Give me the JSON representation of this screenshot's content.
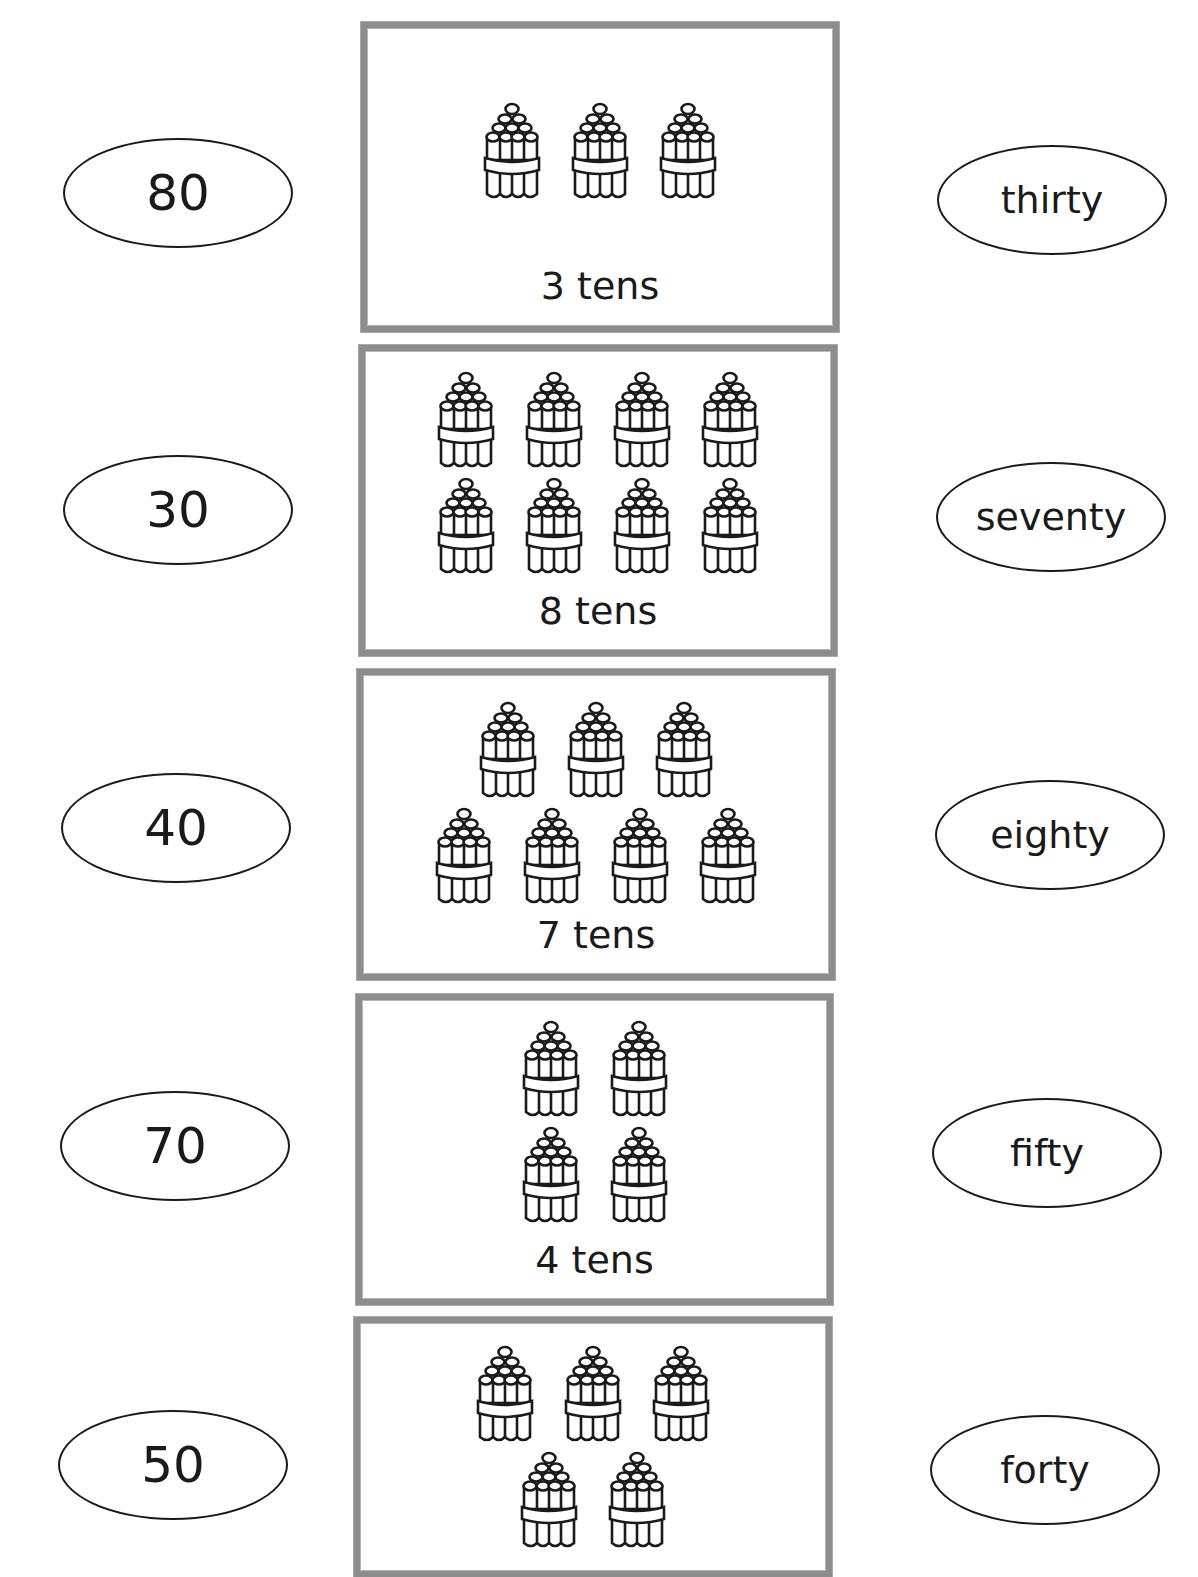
{
  "worksheet": {
    "left_numbers": [
      {
        "label": "80",
        "cx": 178,
        "cy": 193
      },
      {
        "label": "30",
        "cx": 178,
        "cy": 510
      },
      {
        "label": "40",
        "cx": 176,
        "cy": 828
      },
      {
        "label": "70",
        "cx": 175,
        "cy": 1146
      },
      {
        "label": "50",
        "cx": 173,
        "cy": 1465
      }
    ],
    "right_words": [
      {
        "label": "thirty",
        "cx": 1052,
        "cy": 200
      },
      {
        "label": "seventy",
        "cx": 1051,
        "cy": 517
      },
      {
        "label": "eighty",
        "cx": 1050,
        "cy": 835
      },
      {
        "label": "fifty",
        "cx": 1047,
        "cy": 1153
      },
      {
        "label": "forty",
        "cx": 1045,
        "cy": 1470
      }
    ],
    "boxes": [
      {
        "label": "3 tens",
        "tens": 3,
        "rows": [
          3
        ],
        "x": 361,
        "y": 22,
        "w": 478,
        "h": 310,
        "bundles_top": 72,
        "label_top": 236
      },
      {
        "label": "8 tens",
        "tens": 8,
        "rows": [
          4,
          4
        ],
        "x": 359,
        "y": 345,
        "w": 478,
        "h": 311,
        "bundles_top": 18,
        "label_top": 238
      },
      {
        "label": "7 tens",
        "tens": 7,
        "rows": [
          3,
          4
        ],
        "x": 357,
        "y": 669,
        "w": 478,
        "h": 311,
        "bundles_top": 24,
        "label_top": 238
      },
      {
        "label": "4 tens",
        "tens": 4,
        "rows": [
          2,
          2
        ],
        "x": 356,
        "y": 994,
        "w": 477,
        "h": 311,
        "bundles_top": 18,
        "label_top": 238
      },
      {
        "label": "",
        "tens": 5,
        "rows": [
          3,
          2
        ],
        "x": 354,
        "y": 1317,
        "w": 478,
        "h": 260,
        "bundles_top": 20,
        "label_top": 9999
      }
    ],
    "colors": {
      "ink": "#1a1a1a",
      "box_border": "#8d8d8d",
      "background": "#ffffff"
    },
    "icons": {
      "bundle": "bundle-of-ten-sticks-icon"
    }
  }
}
